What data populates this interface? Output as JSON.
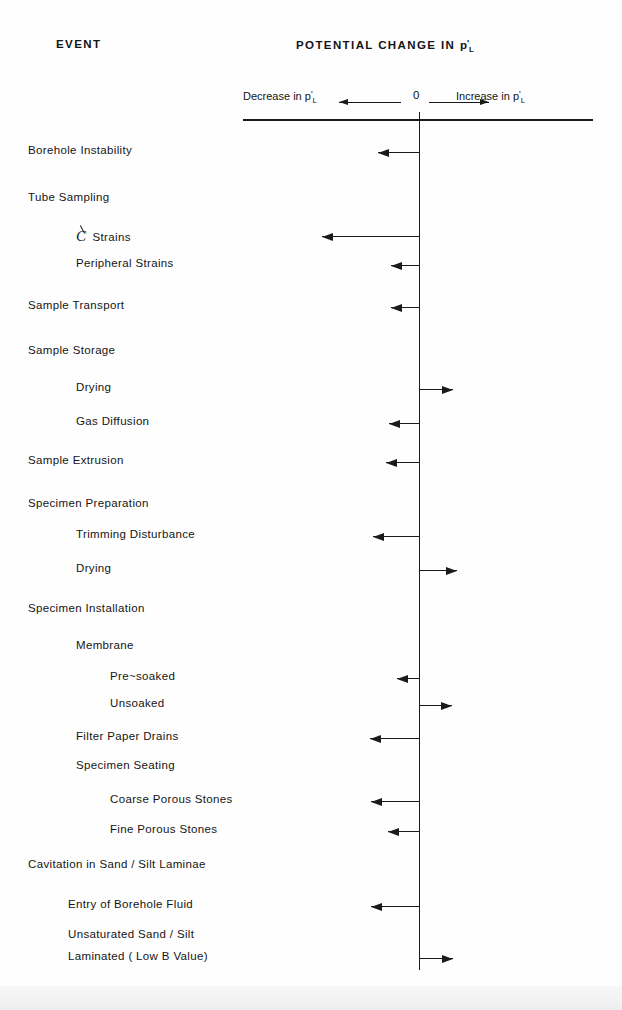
{
  "page": {
    "columns": {
      "event_header": "EVENT",
      "potential_header_prefix": "POTENTIAL CHANGE IN ",
      "potential_header_var": "p",
      "potential_header_prime": "'",
      "potential_header_sub": "L"
    },
    "axis": {
      "decrease_label_prefix": "Decrease in ",
      "increase_label_prefix": "Increase in ",
      "var": "p",
      "prime": "'",
      "sub": "L",
      "zero_label": "0",
      "left_arrow_icon": "arrow-left-icon",
      "right_arrow_icon": "arrow-right-icon"
    },
    "colors": {
      "ink": "#1a1a1a",
      "paper": "#fefefe"
    }
  },
  "chart_data": {
    "type": "bar",
    "xlabel": "Potential change in p'_L (Decrease ← 0 → Increase)",
    "ylabel": "EVENT",
    "orientation": "horizontal",
    "zero_reference": 0,
    "grid": false,
    "legend": null,
    "axis_note": "Qualitative horizontal axis; arrow length indicates relative magnitude of potential change",
    "categories": [
      "Borehole Instability",
      "Tube Sampling",
      "℄ Strains",
      "Peripheral Strains",
      "Sample Transport",
      "Sample Storage",
      "Drying",
      "Gas Diffusion",
      "Sample Extrusion",
      "Specimen Preparation",
      "Trimming Disturbance",
      "Drying",
      "Specimen Installation",
      "Membrane",
      "Pre~soaked",
      "Unsoaked",
      "Filter Paper Drains",
      "Specimen  Seating",
      "Coarse Porous Stones",
      "Fine Porous Stones",
      "Cavitation in Sand / Silt Laminae",
      "Entry of Borehole Fluid",
      "Unsaturated Sand / Silt Laminated ( Low B Value)"
    ],
    "rows": [
      {
        "label": "Borehole Instability",
        "indent": 0,
        "y": 152,
        "direction": "left",
        "magnitude": 41,
        "has_arrow": true
      },
      {
        "label": "Tube Sampling",
        "indent": 0,
        "y": 199,
        "direction": null,
        "magnitude": 0,
        "has_arrow": false
      },
      {
        "label": "℄ Strains",
        "indent": 1,
        "y": 236,
        "direction": "left",
        "magnitude": 97,
        "has_arrow": true
      },
      {
        "label": "Peripheral Strains",
        "indent": 1,
        "y": 265,
        "direction": "left",
        "magnitude": 28,
        "has_arrow": true
      },
      {
        "label": "Sample Transport",
        "indent": 0,
        "y": 307,
        "direction": "left",
        "magnitude": 28,
        "has_arrow": true
      },
      {
        "label": "Sample Storage",
        "indent": 0,
        "y": 352,
        "direction": null,
        "magnitude": 0,
        "has_arrow": false
      },
      {
        "label": "Drying",
        "indent": 1,
        "y": 389,
        "direction": "right",
        "magnitude": 34,
        "has_arrow": true
      },
      {
        "label": "Gas Diffusion",
        "indent": 1,
        "y": 423,
        "direction": "left",
        "magnitude": 30,
        "has_arrow": true
      },
      {
        "label": "Sample Extrusion",
        "indent": 0,
        "y": 462,
        "direction": "left",
        "magnitude": 33,
        "has_arrow": true
      },
      {
        "label": "Specimen Preparation",
        "indent": 0,
        "y": 505,
        "direction": null,
        "magnitude": 0,
        "has_arrow": false
      },
      {
        "label": "Trimming Disturbance",
        "indent": 1,
        "y": 536,
        "direction": "left",
        "magnitude": 46,
        "has_arrow": true
      },
      {
        "label": "Drying",
        "indent": 1,
        "y": 570,
        "direction": "right",
        "magnitude": 38,
        "has_arrow": true
      },
      {
        "label": "Specimen Installation",
        "indent": 0,
        "y": 610,
        "direction": null,
        "magnitude": 0,
        "has_arrow": false
      },
      {
        "label": "Membrane",
        "indent": 1,
        "y": 647,
        "direction": null,
        "magnitude": 0,
        "has_arrow": false
      },
      {
        "label": "Pre~soaked",
        "indent": 2,
        "y": 678,
        "direction": "left",
        "magnitude": 22,
        "has_arrow": true
      },
      {
        "label": "Unsoaked",
        "indent": 2,
        "y": 705,
        "direction": "right",
        "magnitude": 33,
        "has_arrow": true
      },
      {
        "label": "Filter Paper Drains",
        "indent": 1,
        "y": 738,
        "direction": "left",
        "magnitude": 49,
        "has_arrow": true
      },
      {
        "label": "Specimen  Seating",
        "indent": 1,
        "y": 767,
        "direction": null,
        "magnitude": 0,
        "has_arrow": false
      },
      {
        "label": "Coarse Porous Stones",
        "indent": 2,
        "y": 801,
        "direction": "left",
        "magnitude": 48,
        "has_arrow": true
      },
      {
        "label": "Fine Porous Stones",
        "indent": 2,
        "y": 831,
        "direction": "left",
        "magnitude": 31,
        "has_arrow": true
      },
      {
        "label": "Cavitation in Sand / Silt Laminae",
        "indent": 0,
        "y": 866,
        "direction": null,
        "magnitude": 0,
        "has_arrow": false
      },
      {
        "label": "Entry of Borehole Fluid",
        "indent": 3,
        "y": 906,
        "direction": "left",
        "magnitude": 48,
        "has_arrow": true
      },
      {
        "label": "Unsaturated Sand / Silt",
        "indent": 3,
        "y": 936,
        "direction": null,
        "magnitude": 0,
        "has_arrow": false
      },
      {
        "label": "Laminated      ( Low B Value)",
        "indent": 3,
        "y": 958,
        "direction": "right",
        "magnitude": 34,
        "has_arrow": true
      }
    ]
  }
}
